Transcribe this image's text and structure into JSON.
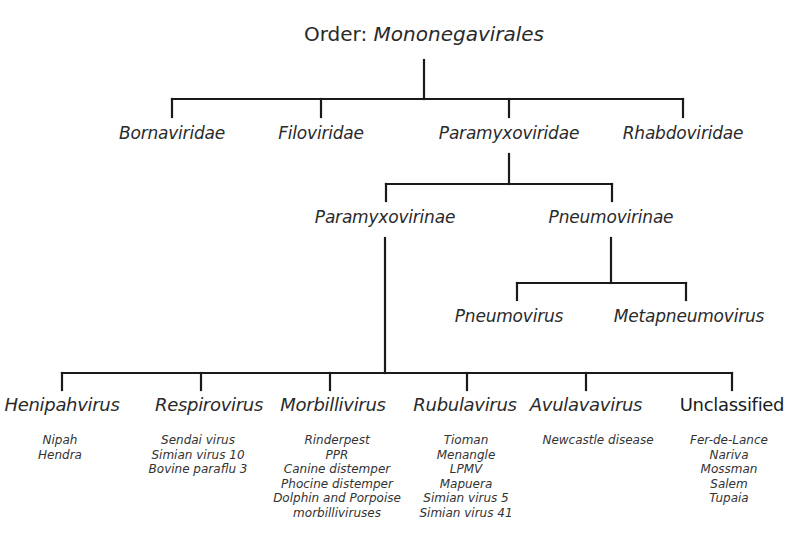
{
  "title": {
    "label": "Order:",
    "name": "Mononegavirales"
  },
  "families": [
    {
      "name": "Bornaviridae"
    },
    {
      "name": "Filoviridae"
    },
    {
      "name": "Paramyxoviridae"
    },
    {
      "name": "Rhabdoviridae"
    }
  ],
  "subfamilies": [
    {
      "name": "Paramyxovirinae"
    },
    {
      "name": "Pneumovirinae"
    }
  ],
  "pneumovirinae_genera": [
    {
      "name": "Pneumovirus"
    },
    {
      "name": "Metapneumovirus"
    }
  ],
  "paramyxovirinae_genera": [
    {
      "name": "Henipahvirus",
      "species": [
        "Nipah",
        "Hendra"
      ]
    },
    {
      "name": "Respirovirus",
      "species": [
        "Sendai virus",
        "Simian virus 10",
        "Bovine paraflu 3"
      ]
    },
    {
      "name": "Morbillivirus",
      "species": [
        "Rinderpest",
        "PPR",
        "Canine distemper",
        "Phocine distemper",
        "Dolphin and Porpoise",
        "morbilliviruses"
      ]
    },
    {
      "name": "Rubulavirus",
      "species": [
        "Tioman",
        "Menangle",
        "LPMV",
        "Mapuera",
        "Simian virus 5",
        "Simian virus 41"
      ]
    },
    {
      "name": "Avulavavirus",
      "species": [
        "Newcastle disease"
      ]
    },
    {
      "name": "Unclassified",
      "species": [
        "Fer-de-Lance",
        "Nariva",
        "Mossman",
        "Salem",
        "Tupaia"
      ]
    }
  ],
  "colors": {
    "line": "#1a1a1a",
    "text": "#2a2a2a",
    "background": "#ffffff"
  }
}
